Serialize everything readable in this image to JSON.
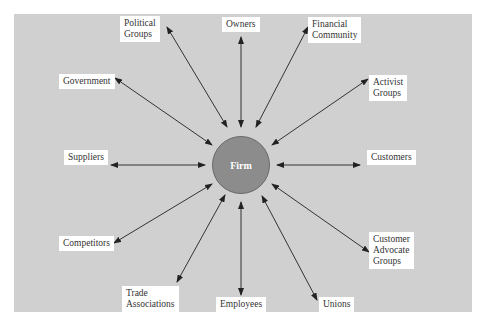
{
  "diagram": {
    "center": {
      "label": "Firm",
      "color": "#8c8c8c"
    },
    "background_color": "#d0d0d0",
    "stakeholders": [
      {
        "id": "political-groups",
        "label": "Political\nGroups",
        "lines": [
          "Political",
          "Groups"
        ]
      },
      {
        "id": "owners",
        "label": "Owners",
        "lines": [
          "Owners"
        ]
      },
      {
        "id": "financial-community",
        "label": "Financial\nCommunity",
        "lines": [
          "Financial",
          "Community"
        ]
      },
      {
        "id": "government",
        "label": "Government",
        "lines": [
          "Government"
        ]
      },
      {
        "id": "activist-groups",
        "label": "Activist\nGroups",
        "lines": [
          "Activist",
          "Groups"
        ]
      },
      {
        "id": "suppliers",
        "label": "Suppliers",
        "lines": [
          "Suppliers"
        ]
      },
      {
        "id": "customers",
        "label": "Customers",
        "lines": [
          "Customers"
        ]
      },
      {
        "id": "competitors",
        "label": "Competitors",
        "lines": [
          "Competitors"
        ]
      },
      {
        "id": "customer-advocate-groups",
        "label": "Customer\nAdvocate\nGroups",
        "lines": [
          "Customer",
          "Advocate",
          "Groups"
        ]
      },
      {
        "id": "trade-associations",
        "label": "Trade\nAssociations",
        "lines": [
          "Trade",
          "Associations"
        ]
      },
      {
        "id": "employees",
        "label": "Employees",
        "lines": [
          "Employees"
        ]
      },
      {
        "id": "unions",
        "label": "Unions",
        "lines": [
          "Unions"
        ]
      }
    ],
    "connection_type": "bidirectional-arrow"
  }
}
